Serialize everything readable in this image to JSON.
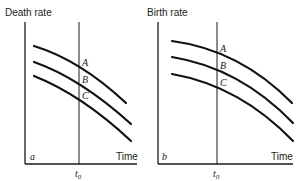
{
  "panels": [
    {
      "id": "a",
      "panel_label": "a",
      "y_axis_label": "Death rate",
      "x_axis_label": "Time",
      "marker_label": "t",
      "marker_subscript": "0",
      "curves": [
        {
          "name": "A",
          "label": "A"
        },
        {
          "name": "B",
          "label": "B"
        },
        {
          "name": "C",
          "label": "C"
        }
      ]
    },
    {
      "id": "b",
      "panel_label": "b",
      "y_axis_label": "Birth rate",
      "x_axis_label": "Time",
      "marker_label": "t",
      "marker_subscript": "0",
      "curves": [
        {
          "name": "A",
          "label": "A"
        },
        {
          "name": "B",
          "label": "B"
        },
        {
          "name": "C",
          "label": "C"
        }
      ]
    }
  ]
}
